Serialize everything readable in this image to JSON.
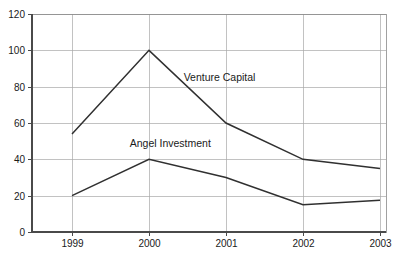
{
  "chart_data": {
    "type": "line",
    "title": "",
    "subtitle": "",
    "xlabel": "",
    "ylabel": "",
    "categories": [
      "1999",
      "2000",
      "2001",
      "2002",
      "2003"
    ],
    "x_tick_labels": [
      "1999",
      "2000",
      "2001",
      "2002",
      "2003"
    ],
    "y_tick_labels": [
      "0",
      "20",
      "40",
      "60",
      "80",
      "100",
      "120"
    ],
    "y_ticks": [
      0,
      20,
      40,
      60,
      80,
      100,
      120
    ],
    "ylim": [
      0,
      120
    ],
    "grid": "horizontal-and-vertical",
    "legend_position": "inline-annotations",
    "series": [
      {
        "name": "Venture Capital",
        "label": "Venture Capital",
        "color": "#303030",
        "values": [
          54,
          100,
          60,
          40,
          35
        ],
        "label_x": 2000.45,
        "label_y": 83
      },
      {
        "name": "Angel Investment",
        "label": "Angel Investment",
        "color": "#303030",
        "values": [
          20,
          40,
          30,
          15,
          17.5
        ],
        "label_x": 1999.75,
        "label_y": 47
      }
    ],
    "annotations": [
      {
        "text": "Venture Capital"
      },
      {
        "text": "Angel Investment"
      }
    ],
    "colors": {
      "background": "#ffffff",
      "gridline": "#a8a8a8",
      "axis": "#4a4a4a",
      "line": "#303030",
      "text": "#1a1a1a"
    }
  }
}
